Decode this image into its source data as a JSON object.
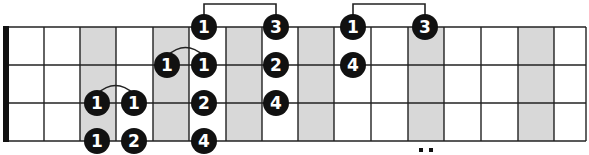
{
  "diagram": {
    "type": "fretboard-fingering-chart",
    "title_partial": "... (shapes)",
    "strings": 4,
    "frets_visible": 16,
    "shaded_fret_columns": [
      3,
      5,
      7,
      9,
      12,
      15
    ],
    "fret_marker_double_dot_at": 12,
    "colors": {
      "background": "#ffffff",
      "shade": "#d8d8d8",
      "lines": "#222222",
      "nut": "#111111",
      "dot_fill": "#111111",
      "dot_text": "#ffffff"
    },
    "notes": [
      {
        "string": 1,
        "x": 204,
        "finger": "1"
      },
      {
        "string": 1,
        "x": 276,
        "finger": "3"
      },
      {
        "string": 1,
        "x": 353,
        "finger": "1"
      },
      {
        "string": 1,
        "x": 425,
        "finger": "3"
      },
      {
        "string": 2,
        "x": 167,
        "finger": "1"
      },
      {
        "string": 2,
        "x": 204,
        "finger": "1"
      },
      {
        "string": 2,
        "x": 276,
        "finger": "2"
      },
      {
        "string": 2,
        "x": 353,
        "finger": "4"
      },
      {
        "string": 3,
        "x": 97,
        "finger": "1"
      },
      {
        "string": 3,
        "x": 134,
        "finger": "1"
      },
      {
        "string": 3,
        "x": 204,
        "finger": "2"
      },
      {
        "string": 3,
        "x": 276,
        "finger": "4"
      },
      {
        "string": 4,
        "x": 97,
        "finger": "1"
      },
      {
        "string": 4,
        "x": 134,
        "finger": "2"
      },
      {
        "string": 4,
        "x": 204,
        "finger": "4"
      }
    ],
    "slurs": [
      {
        "string": 2,
        "from_x": 167,
        "to_x": 204
      },
      {
        "string": 3,
        "from_x": 97,
        "to_x": 134
      }
    ],
    "brackets": [
      {
        "from_x": 204,
        "to_x": 276
      },
      {
        "from_x": 353,
        "to_x": 425
      }
    ]
  }
}
